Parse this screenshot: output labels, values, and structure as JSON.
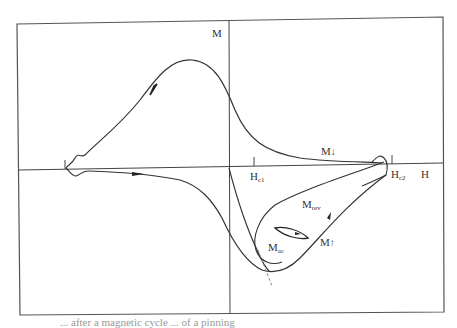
{
  "diagram": {
    "type": "magnetization-hysteresis",
    "axes": {
      "y_label": "M",
      "x_label": "H"
    },
    "tick_labels": {
      "hc1_main": "H",
      "hc1_sub": "c1",
      "hc2_main": "H",
      "hc2_sub": "c2"
    },
    "curve_labels": {
      "m_down": "M",
      "m_down_arrow": "↓",
      "m_rev_main": "M",
      "m_rev_sub": "rev",
      "m_ac_main": "M",
      "m_ac_sub": "ac",
      "m_up": "M",
      "m_up_arrow": "↑"
    },
    "colors": {
      "line": "#333333",
      "frame": "#555555",
      "dashed": "#888888"
    }
  },
  "caption": {
    "text_fragment": "... after a magnetic cycle ... of a pinning"
  }
}
